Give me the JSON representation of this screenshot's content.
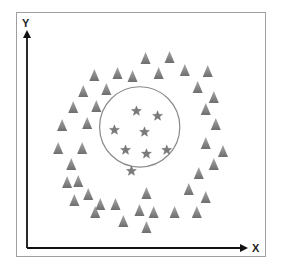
{
  "chart_data": {
    "type": "scatter",
    "title": "",
    "xlabel": "X",
    "ylabel": "Y",
    "xlim": [
      0,
      100
    ],
    "ylim": [
      0,
      100
    ],
    "grid": false,
    "legend": "none",
    "ticks": false,
    "boundary_circle": {
      "cx": 51.7,
      "cy": 54.3,
      "r_x": 18.4,
      "r_y": 18.0,
      "stroke": "#8a8a8a"
    },
    "series": [
      {
        "name": "outer-class",
        "marker": "triangle",
        "color": "#8c8c8c",
        "points": [
          [
            30.9,
            77.6
          ],
          [
            41.5,
            78.5
          ],
          [
            48.4,
            77.1
          ],
          [
            25.8,
            70.4
          ],
          [
            36.4,
            71.3
          ],
          [
            21.2,
            63.2
          ],
          [
            31.8,
            63.7
          ],
          [
            16.1,
            55.2
          ],
          [
            27.6,
            56.1
          ],
          [
            54.4,
            85.2
          ],
          [
            65.4,
            85.7
          ],
          [
            60.4,
            78.5
          ],
          [
            72.4,
            79.8
          ],
          [
            82.9,
            79.4
          ],
          [
            78.3,
            72.2
          ],
          [
            85.7,
            67.7
          ],
          [
            82.0,
            62.3
          ],
          [
            86.6,
            55.6
          ],
          [
            14.3,
            44.8
          ],
          [
            25.3,
            44.8
          ],
          [
            20.3,
            37.7
          ],
          [
            18.4,
            29.6
          ],
          [
            23.5,
            30.0
          ],
          [
            21.7,
            21.5
          ],
          [
            28.1,
            24.2
          ],
          [
            33.6,
            19.7
          ],
          [
            31.3,
            16.1
          ],
          [
            40.6,
            19.7
          ],
          [
            44.2,
            12.1
          ],
          [
            51.6,
            17.0
          ],
          [
            82.0,
            47.1
          ],
          [
            89.9,
            43.5
          ],
          [
            85.7,
            37.7
          ],
          [
            78.8,
            33.6
          ],
          [
            74.2,
            26.5
          ],
          [
            82.0,
            22.9
          ],
          [
            54.8,
            24.7
          ],
          [
            58.1,
            16.1
          ],
          [
            67.7,
            16.1
          ],
          [
            77.9,
            16.1
          ],
          [
            54.8,
            9.4
          ]
        ]
      },
      {
        "name": "inner-class",
        "marker": "star",
        "color": "#7a7a7a",
        "points": [
          [
            50.2,
            61.4
          ],
          [
            59.9,
            59.2
          ],
          [
            40.1,
            52.9
          ],
          [
            53.9,
            52.0
          ],
          [
            45.2,
            43.9
          ],
          [
            54.8,
            42.2
          ],
          [
            64.1,
            43.9
          ],
          [
            47.9,
            34.5
          ]
        ]
      }
    ]
  }
}
